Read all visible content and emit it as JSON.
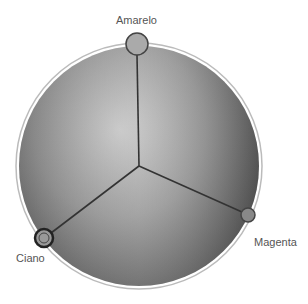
{
  "color_wheel": {
    "handles": [
      {
        "name": "Amarelo",
        "x": 137,
        "y": 44
      },
      {
        "name": "Magenta",
        "x": 248,
        "y": 215
      },
      {
        "name": "Ciano",
        "x": 44,
        "y": 238
      }
    ],
    "center": {
      "x": 139,
      "y": 166
    },
    "radius": 121
  },
  "labels": {
    "amarelo": "Amarelo",
    "magenta": "Magenta",
    "ciano": "Ciano"
  }
}
